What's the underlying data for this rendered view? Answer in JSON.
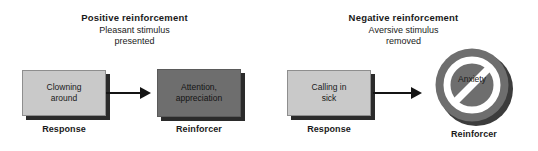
{
  "diagram": {
    "colors": {
      "light_box": "#c9c9c9",
      "dark_box": "#6e6e6e",
      "sign": "#6e6e6e",
      "shadow": "#2b2b2b",
      "text": "#1a1a1a",
      "background": "#ffffff"
    },
    "panels": [
      {
        "id": "positive",
        "heading": "Positive reinforcement",
        "subheading": "Pleasant stimulus\npresented",
        "response": {
          "text": "Clowning\naround",
          "caption": "Response"
        },
        "reinforcer": {
          "text": "Attention,\nappreciation",
          "caption": "Reinforcer",
          "shape": "box"
        }
      },
      {
        "id": "negative",
        "heading": "Negative reinforcement",
        "subheading": "Aversive stimulus\nremoved",
        "response": {
          "text": "Calling in\nsick",
          "caption": "Response"
        },
        "reinforcer": {
          "text": "Anxiety",
          "caption": "Reinforcer",
          "shape": "prohibition-sign"
        }
      }
    ]
  }
}
